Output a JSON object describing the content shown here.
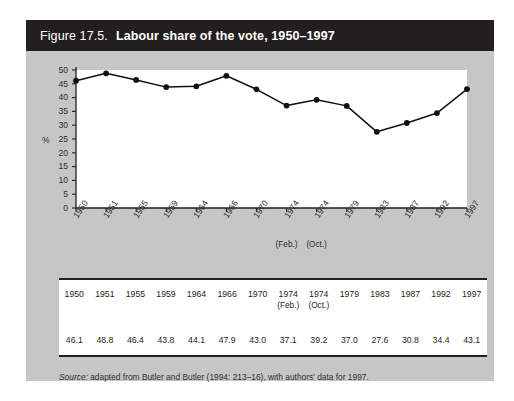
{
  "figure": {
    "number_label": "Figure 17.5.",
    "title": "Labour share of the vote, 1950–1997",
    "source_label": "Source:",
    "source_text": " adapted from Butler and Butler (1994: 213–16), with authors' data for 1997.",
    "background_color": "#c6c6c6",
    "title_bar_color": "#231f20"
  },
  "chart_data": {
    "type": "line",
    "title": "Labour share of the vote, 1950–1997",
    "xlabel": "",
    "ylabel": "%",
    "ylim": [
      0,
      50
    ],
    "yticks": [
      0,
      5,
      10,
      15,
      20,
      25,
      30,
      35,
      40,
      45,
      50
    ],
    "ytick_labels": [
      "0",
      "5",
      "10",
      "15",
      "20",
      "25",
      "30",
      "35",
      "40",
      "45",
      "50"
    ],
    "grid": false,
    "legend": "none",
    "marker": "filled-circle",
    "line_color": "#111111",
    "categories": [
      "1950",
      "1951",
      "1955",
      "1959",
      "1964",
      "1966",
      "1970",
      "1974",
      "1974",
      "1979",
      "1983",
      "1987",
      "1992",
      "1997"
    ],
    "category_subs": [
      "",
      "",
      "",
      "",
      "",
      "",
      "",
      "(Feb.)",
      "(Oct.)",
      "",
      "",
      "",
      "",
      ""
    ],
    "values": [
      46.1,
      48.8,
      46.4,
      43.8,
      44.1,
      47.9,
      43.0,
      37.1,
      39.2,
      37.0,
      27.6,
      30.8,
      34.4,
      43.1
    ]
  },
  "table": {
    "header": [
      "1950",
      "1951",
      "1955",
      "1959",
      "1964",
      "1966",
      "1970",
      "1974",
      "1974",
      "1979",
      "1983",
      "1987",
      "1992",
      "1997"
    ],
    "header_subs": [
      "",
      "",
      "",
      "",
      "",
      "",
      "",
      "(Feb.)",
      "(Oct.)",
      "",
      "",
      "",
      "",
      ""
    ],
    "values": [
      "46.1",
      "48.8",
      "46.4",
      "43.8",
      "44.1",
      "47.9",
      "43.0",
      "37.1",
      "39.2",
      "37.0",
      "27.6",
      "30.8",
      "34.4",
      "43.1"
    ]
  }
}
